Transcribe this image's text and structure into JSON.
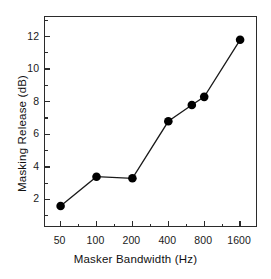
{
  "chart_data": {
    "type": "line",
    "title": "",
    "xlabel": "Masker Bandwidth (Hz)",
    "ylabel": "Masking Release (dB)",
    "x": [
      50,
      100,
      200,
      400,
      630,
      800,
      1600
    ],
    "values": [
      1.6,
      3.4,
      3.3,
      6.8,
      7.8,
      8.3,
      11.8
    ],
    "series": [
      {
        "name": "Masking Release",
        "values": [
          1.6,
          3.4,
          3.3,
          6.8,
          7.8,
          8.3,
          11.8
        ]
      }
    ],
    "xscale": "log2",
    "xlim": [
      37,
      2260
    ],
    "ylim": [
      0.25,
      13.2
    ],
    "xticks": [
      50,
      100,
      200,
      400,
      800,
      1600
    ],
    "xtick_labels": [
      "50",
      "100",
      "200",
      "400",
      "800",
      "1600"
    ],
    "yticks": [
      2,
      4,
      6,
      8,
      10,
      12
    ],
    "ytick_labels": [
      "2",
      "4",
      "6",
      "8",
      "10",
      "12"
    ],
    "yticks_minor": [
      1,
      3,
      5,
      7,
      9,
      11,
      13
    ],
    "grid": false,
    "legend": null,
    "marker": "filled-circle",
    "marker_color": "#000000",
    "line_color": "#1a1a1a",
    "axis_color": "#2b2b2b",
    "background": "#ffffff"
  }
}
